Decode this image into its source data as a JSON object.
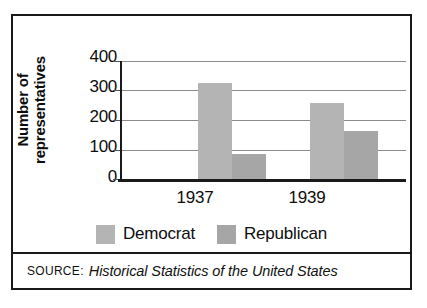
{
  "chart_data": {
    "type": "bar",
    "title": "",
    "subtitle": "",
    "xlabel": "",
    "ylabel": "Number of representatives",
    "ylabel_line1": "Number of",
    "ylabel_line2": "representatives",
    "categories": [
      "1937",
      "1939"
    ],
    "series": [
      {
        "name": "Democrat",
        "color": "#b4b4b4",
        "values": [
          330,
          262
        ]
      },
      {
        "name": "Republican",
        "color": "#a6a6a6",
        "values": [
          88,
          165
        ]
      }
    ],
    "ylim": [
      0,
      400
    ],
    "yticks": [
      400,
      300,
      200,
      100,
      0
    ],
    "ytick_labels": [
      "400",
      "300",
      "200",
      "100",
      "0"
    ],
    "grid": true,
    "grid_axis": "y",
    "legend_position": "bottom"
  },
  "legend": {
    "entries": [
      {
        "label": "Democrat",
        "color": "#b4b4b4"
      },
      {
        "label": "Republican",
        "color": "#a6a6a6"
      }
    ]
  },
  "source": {
    "prefix": "SOURCE:",
    "title": "Historical Statistics of the United States"
  },
  "colors": {
    "democrat": "#b4b4b4",
    "republican": "#a6a6a6",
    "axis": "#1a1a1a",
    "gridline": "#8c8c8c",
    "text": "#0d0d0d",
    "border": "#1a1a1a"
  }
}
